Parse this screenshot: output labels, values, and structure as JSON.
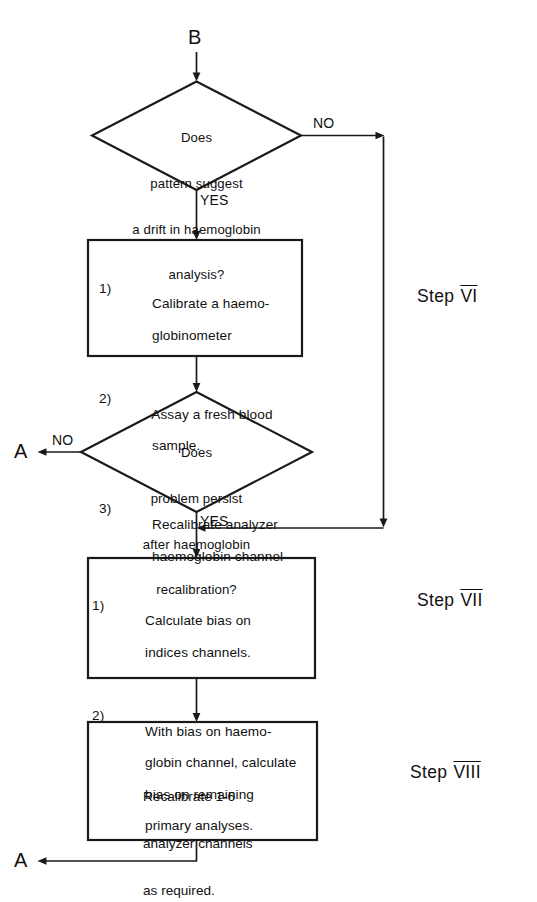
{
  "diagram": {
    "type": "flowchart",
    "background_color": "#ffffff",
    "line_color": "#1a1a1a"
  },
  "connectors": {
    "entry_b": "B",
    "exit_a_middle": "A",
    "exit_a_bottom": "A"
  },
  "decisions": [
    {
      "id": "decision-drift",
      "lines": [
        "Does",
        "pattern suggest",
        "a drift in haemoglobin",
        "analysis?"
      ],
      "yes_label": "YES",
      "no_label": "NO"
    },
    {
      "id": "decision-persist",
      "lines": [
        "Does",
        "problem persist",
        "after haemoglobin",
        "recalibration?"
      ],
      "yes_label": "YES",
      "no_label": "NO"
    }
  ],
  "processes": [
    {
      "id": "process-calibrate",
      "items": [
        {
          "num": "1)",
          "lines": [
            "Calibrate a haemo-",
            "globinometer"
          ]
        },
        {
          "num": "2)",
          "lines": [
            "Assay a fresh blood",
            "sample."
          ]
        },
        {
          "num": "3)",
          "lines": [
            "Recalibrate analyzer",
            "haemoglobin channel"
          ]
        }
      ]
    },
    {
      "id": "process-bias",
      "items": [
        {
          "num": "1)",
          "lines": [
            "Calculate bias on",
            "indices channels."
          ]
        },
        {
          "num": "2)",
          "lines": [
            "With bias on haemo-",
            "globin channel, calculate",
            "bias on remaining",
            "primary analyses."
          ]
        }
      ]
    },
    {
      "id": "process-recalibrate",
      "lines": [
        "Recalibrate 1-6",
        "analyzer channels",
        "as required."
      ]
    }
  ],
  "steps": [
    {
      "id": "step-6",
      "word": "Step",
      "numeral": "VI"
    },
    {
      "id": "step-7",
      "word": "Step",
      "numeral": "VII"
    },
    {
      "id": "step-8",
      "word": "Step",
      "numeral": "VIII"
    }
  ]
}
